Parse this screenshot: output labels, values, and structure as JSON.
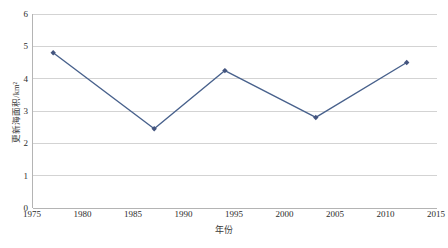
{
  "chart_data": {
    "type": "line",
    "title": "",
    "xlabel": "年份",
    "ylabel": "更新海面积/km²",
    "xlim": [
      1975,
      2015
    ],
    "ylim": [
      0,
      6
    ],
    "xticks": [
      1975,
      1980,
      1985,
      1990,
      1995,
      2000,
      2005,
      2010,
      2015
    ],
    "yticks": [
      0,
      1,
      2,
      3,
      4,
      5,
      6
    ],
    "grid": "horizontal",
    "legend": "none",
    "series": [
      {
        "name": "更新海面积",
        "x": [
          1977,
          1987,
          1994,
          2003,
          2012
        ],
        "values": [
          4.8,
          2.45,
          4.25,
          2.8,
          4.5
        ]
      }
    ],
    "colors": {
      "line": "#48618C",
      "marker": "#44557F",
      "grid": "#D3D3D3",
      "axis": "#B4B4B4",
      "text": "#2B2B2B",
      "background": "#FFFFFF"
    }
  }
}
